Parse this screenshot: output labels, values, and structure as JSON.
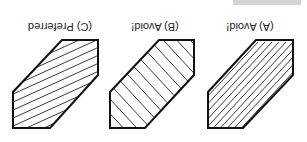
{
  "figure": {
    "orientation": "rotated 180 degrees",
    "panels": [
      {
        "id": "A",
        "label": "(A) Avoid!",
        "hatch": "lines parallel to long edges"
      },
      {
        "id": "B",
        "label": "(B) Avoid!",
        "hatch": "lines perpendicular to long edges"
      },
      {
        "id": "C",
        "label": "(C) Preferred",
        "hatch": "lines at an angle to all edges"
      }
    ]
  },
  "colors": {
    "stroke": "#111111",
    "background": "#ffffff",
    "bar": "#d4d4d4"
  }
}
